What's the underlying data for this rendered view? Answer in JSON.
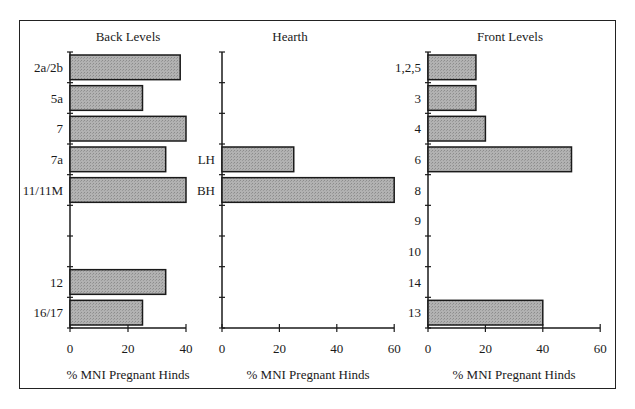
{
  "chart_data": [
    {
      "type": "bar",
      "orientation": "horizontal",
      "title": "Back Levels",
      "xlabel": "% MNI Pregnant Hinds",
      "ylabel": "",
      "xlim": [
        0,
        40
      ],
      "xticks": [
        0,
        20,
        40
      ],
      "categories": [
        "2a/2b",
        "5a",
        "7",
        "7a",
        "11/11M",
        "",
        "",
        "12",
        "16/17"
      ],
      "values": [
        38,
        25,
        40,
        33,
        40,
        null,
        null,
        33,
        25
      ],
      "grid": false
    },
    {
      "type": "bar",
      "orientation": "horizontal",
      "title": "Hearth",
      "xlabel": "% MNI Pregnant Hinds",
      "ylabel": "",
      "xlim": [
        0,
        60
      ],
      "xticks": [
        0,
        20,
        40,
        60
      ],
      "categories": [
        "",
        "",
        "",
        "LH",
        "BH",
        "",
        "",
        "",
        ""
      ],
      "values": [
        null,
        null,
        null,
        25,
        60,
        null,
        null,
        null,
        null
      ],
      "grid": false
    },
    {
      "type": "bar",
      "orientation": "horizontal",
      "title": "Front Levels",
      "xlabel": "% MNI Pregnant Hinds",
      "ylabel": "",
      "xlim": [
        0,
        60
      ],
      "xticks": [
        0,
        20,
        40,
        60
      ],
      "categories": [
        "1,2,5",
        "3",
        "4",
        "6",
        "8",
        "9",
        "10",
        "14",
        "13"
      ],
      "values": [
        16.7,
        16.7,
        20,
        50,
        0,
        0,
        0,
        0,
        40
      ],
      "grid": false
    }
  ],
  "colors": {
    "bar_fill": "#a9a9a9",
    "bar_stroke": "#1a1a1a",
    "axis": "#1a1a1a",
    "frame": "#222222"
  },
  "panels": {
    "back": {
      "title": "Back Levels",
      "xlabel": "% MNI Pregnant Hinds"
    },
    "hearth": {
      "title": "Hearth",
      "xlabel": "% MNI Pregnant Hinds"
    },
    "front": {
      "title": "Front Levels",
      "xlabel": "% MNI Pregnant Hinds"
    }
  }
}
